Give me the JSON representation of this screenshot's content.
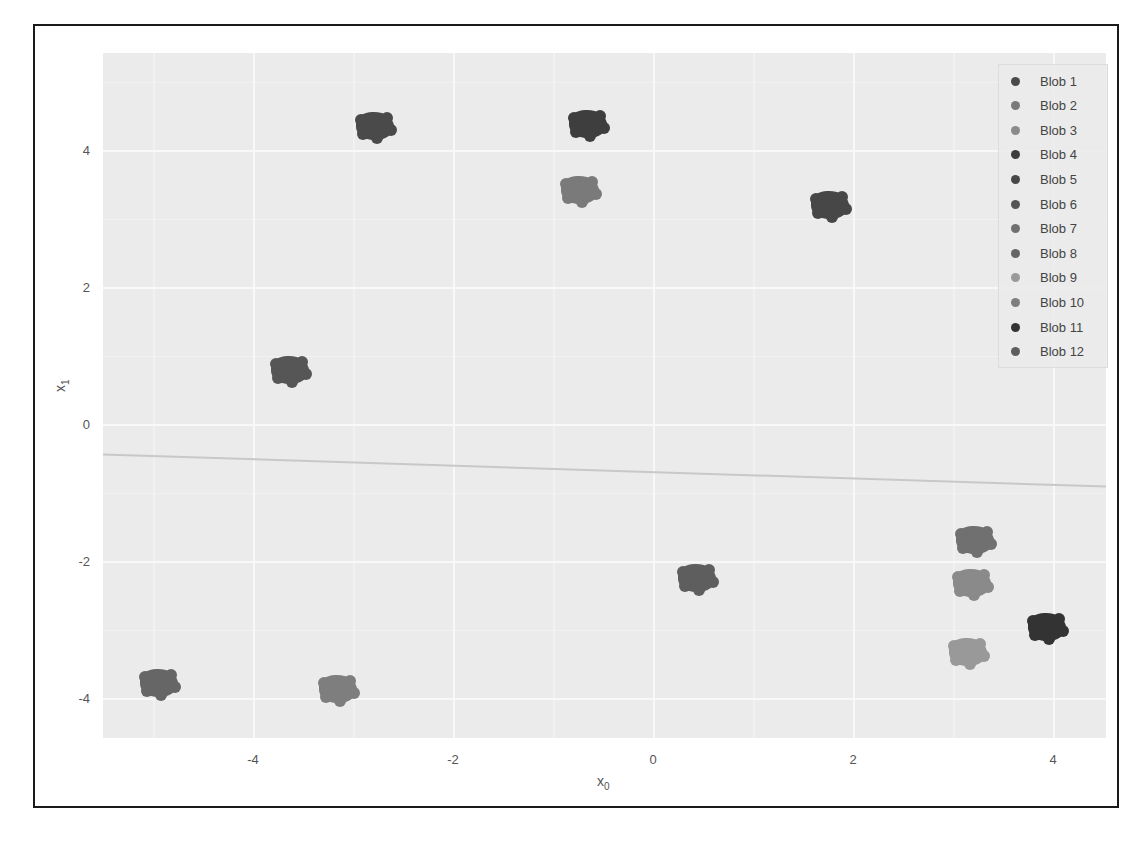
{
  "chart_data": {
    "type": "scatter",
    "title": "",
    "xlabel": "x0",
    "ylabel": "x1",
    "xlim": [
      -5.5,
      4.53
    ],
    "ylim": [
      -4.58,
      5.42
    ],
    "x_ticks": [
      "-4",
      "-2",
      "0",
      "2",
      "4"
    ],
    "y_ticks": [
      "4",
      "2",
      "0",
      "-2",
      "-4"
    ],
    "grid": true,
    "legend_position": "upper right",
    "series": [
      {
        "name": "Blob 1",
        "color": "#4a4a4a",
        "center": [
          -2.78,
          4.36
        ]
      },
      {
        "name": "Blob 2",
        "color": "#7a7a7a",
        "center": [
          -0.73,
          3.42
        ]
      },
      {
        "name": "Blob 3",
        "color": "#8a8a8a",
        "center": [
          3.19,
          -2.32
        ]
      },
      {
        "name": "Blob 4",
        "color": "#3e3e3e",
        "center": [
          -0.65,
          4.39
        ]
      },
      {
        "name": "Blob 5",
        "color": "#474747",
        "center": [
          1.77,
          3.2
        ]
      },
      {
        "name": "Blob 6",
        "color": "#565656",
        "center": [
          -3.63,
          0.79
        ]
      },
      {
        "name": "Blob 7",
        "color": "#707070",
        "center": [
          3.22,
          -1.69
        ]
      },
      {
        "name": "Blob 8",
        "color": "#666666",
        "center": [
          -4.94,
          -3.77
        ]
      },
      {
        "name": "Blob 9",
        "color": "#999999",
        "center": [
          3.15,
          -3.33
        ]
      },
      {
        "name": "Blob 10",
        "color": "#7e7e7e",
        "center": [
          -3.15,
          -3.87
        ]
      },
      {
        "name": "Blob 11",
        "color": "#333333",
        "center": [
          3.94,
          -2.96
        ]
      },
      {
        "name": "Blob 12",
        "color": "#5e5e5e",
        "center": [
          0.44,
          -2.25
        ]
      }
    ],
    "line": {
      "x": [
        -5.5,
        4.53
      ],
      "y": [
        -0.44,
        -0.91
      ],
      "color": "#c8c8c8"
    }
  },
  "axes": {
    "xlabel_main": "x",
    "xlabel_sub": "0",
    "ylabel_main": "x",
    "ylabel_sub": "1"
  },
  "legend": {
    "items": [
      "Blob 1",
      "Blob 2",
      "Blob 3",
      "Blob 4",
      "Blob 5",
      "Blob 6",
      "Blob 7",
      "Blob 8",
      "Blob 9",
      "Blob 10",
      "Blob 11",
      "Blob 12"
    ]
  }
}
